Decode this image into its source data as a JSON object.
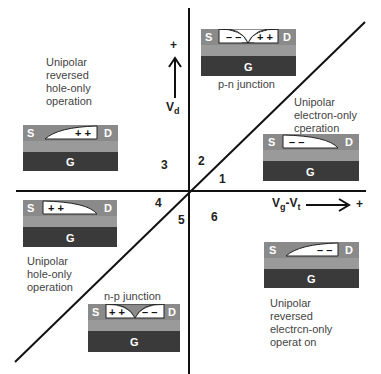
{
  "axes": {
    "x_label_main": "V",
    "x_label_sub1": "g",
    "x_label_mid": "-V",
    "x_label_sub2": "t",
    "x_plus": "+",
    "y_label_main": "V",
    "y_label_sub": "d",
    "y_plus": "+"
  },
  "regions": [
    {
      "number": "1"
    },
    {
      "number": "2"
    },
    {
      "number": "3"
    },
    {
      "number": "4"
    },
    {
      "number": "5"
    },
    {
      "number": "6"
    }
  ],
  "labels": {
    "top_left": [
      "Unipolar",
      "reversed",
      "hole-only",
      "operation"
    ],
    "top_center": "p-n junction",
    "right_upper": [
      "Unipolar",
      "electron-only",
      "cperation"
    ],
    "left_lower": [
      "Unipolar",
      "hole-only",
      "operation"
    ],
    "bottom_center": "n-p junction",
    "right_lower": [
      "Unipolar",
      "reversed",
      "electrcn-only",
      "operat on"
    ]
  },
  "devices": {
    "source": "S",
    "drain": "D",
    "gate": "G",
    "top": {
      "left_charge": "– –",
      "right_charge": "+ +"
    },
    "left_upper": {
      "charge": "+ +"
    },
    "right_upper": {
      "charge": "– –"
    },
    "left_lower": {
      "charge": "+ +"
    },
    "bottom": {
      "left_charge": "+ +",
      "right_charge": "– –"
    },
    "right_lower": {
      "charge": "– –"
    }
  },
  "colors": {
    "electrode": "#8a8a8a",
    "channel": "#9a9a9a",
    "gate": "#3a3a3a",
    "line": "#111111"
  }
}
